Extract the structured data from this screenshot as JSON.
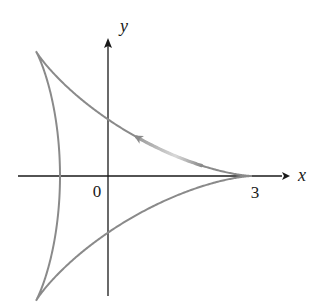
{
  "figure": {
    "axes": {
      "x_label": "x",
      "y_label": "y",
      "origin_label": "0",
      "x_tick_label": "3"
    },
    "curve": {
      "name": "deltoid",
      "parametric": "x = 2cos t + cos 2t, y = 2sin t - sin 2t",
      "cusps": [
        [
          3,
          0
        ],
        [
          -1.5,
          2.598
        ],
        [
          -1.5,
          -2.598
        ]
      ],
      "color": "#8a8a8a",
      "direction": "counterclockwise from (3,0)"
    },
    "colors": {
      "axis": "#1a1a1a",
      "curve": "#8a8a8a",
      "arrow_highlight": "#c8c8c8"
    }
  }
}
